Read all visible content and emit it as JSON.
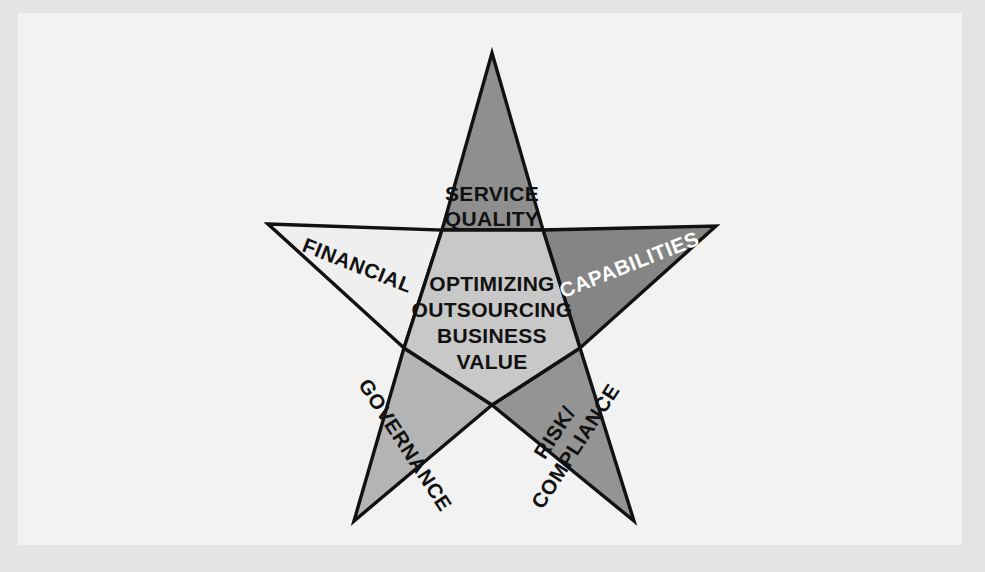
{
  "diagram": {
    "type": "five-point-star",
    "title_center": {
      "lines": [
        "OPTIMIZING",
        "OUTSOURCING",
        "BUSINESS",
        "VALUE"
      ],
      "line1": "OPTIMIZING",
      "line2": "OUTSOURCING",
      "line3": "BUSINESS",
      "line4": "VALUE"
    },
    "points": [
      {
        "id": "service-quality",
        "position": "top",
        "label_line1": "SERVICE",
        "label_line2": "QUALITY",
        "fill": "#8f8f8f",
        "text_color": "#111111"
      },
      {
        "id": "capabilities",
        "position": "right",
        "label": "CAPABILITIES",
        "fill": "#858585",
        "text_color": "#ffffff"
      },
      {
        "id": "risk-compliance",
        "position": "bottom-right",
        "label_line1": "RISK/",
        "label_line2": "COMPLIANCE",
        "fill": "#949494",
        "text_color": "#111111"
      },
      {
        "id": "governance",
        "position": "bottom-left",
        "label": "GOVERNANCE",
        "fill": "#b4b4b4",
        "text_color": "#111111"
      },
      {
        "id": "financial",
        "position": "left",
        "label": "FINANCIAL",
        "fill": "#efefef",
        "text_color": "#111111"
      }
    ],
    "center_fill": "#c8c8c8",
    "outline_color": "#111111",
    "background": "#f2f2f2",
    "page_background": "#e4e4e6"
  }
}
